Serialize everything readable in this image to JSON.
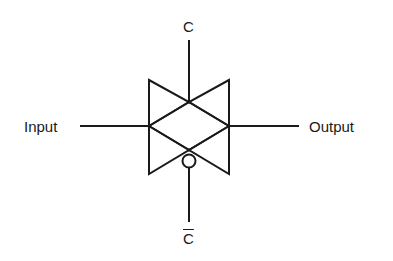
{
  "diagram": {
    "type": "transmission-gate",
    "labels": {
      "control": "C",
      "control_complement": "C",
      "input": "Input",
      "output": "Output"
    },
    "stroke_color": "#1a1a1a",
    "background": "#ffffff"
  }
}
